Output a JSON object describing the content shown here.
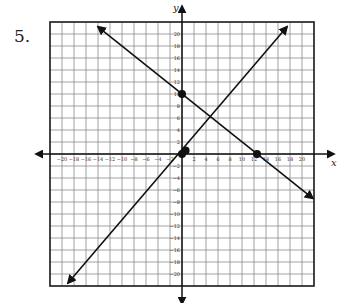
{
  "problem": {
    "number_label": "5."
  },
  "chart_data": {
    "type": "line",
    "title": "",
    "xlabel": "x",
    "ylabel": "y",
    "xlim": [
      -22,
      22
    ],
    "ylim": [
      -22,
      22
    ],
    "grid": true,
    "grid_step": 2,
    "x_ticks": [
      -20,
      -18,
      -16,
      -14,
      -12,
      -10,
      -8,
      -6,
      -4,
      -2,
      2,
      4,
      6,
      8,
      10,
      12,
      14,
      16,
      18,
      20
    ],
    "y_ticks": [
      20,
      18,
      16,
      14,
      12,
      10,
      8,
      6,
      4,
      2,
      -2,
      -4,
      -6,
      -8,
      -10,
      -12,
      -14,
      -16,
      -18,
      -20
    ],
    "series": [
      {
        "name": "line-decreasing",
        "points": [
          [
            0,
            10
          ],
          [
            12.5,
            0
          ]
        ],
        "endpoints": [
          [
            -14,
            21.2
          ],
          [
            21.8,
            -7.4
          ]
        ],
        "slope": -0.8,
        "y_intercept": 10
      },
      {
        "name": "line-increasing",
        "points": [
          [
            0,
            0
          ],
          [
            0.6,
            0.6
          ]
        ],
        "endpoints": [
          [
            -19,
            -21.5
          ],
          [
            17.5,
            21.2
          ]
        ],
        "slope": 1.16,
        "y_intercept": 0
      }
    ],
    "marked_points": [
      [
        0,
        10
      ],
      [
        12.5,
        0
      ],
      [
        0,
        0
      ],
      [
        0.6,
        0.6
      ]
    ]
  },
  "colors": {
    "grid": "#8a8a8a",
    "axis": "#111111",
    "line": "#111111",
    "border": "#222222"
  }
}
